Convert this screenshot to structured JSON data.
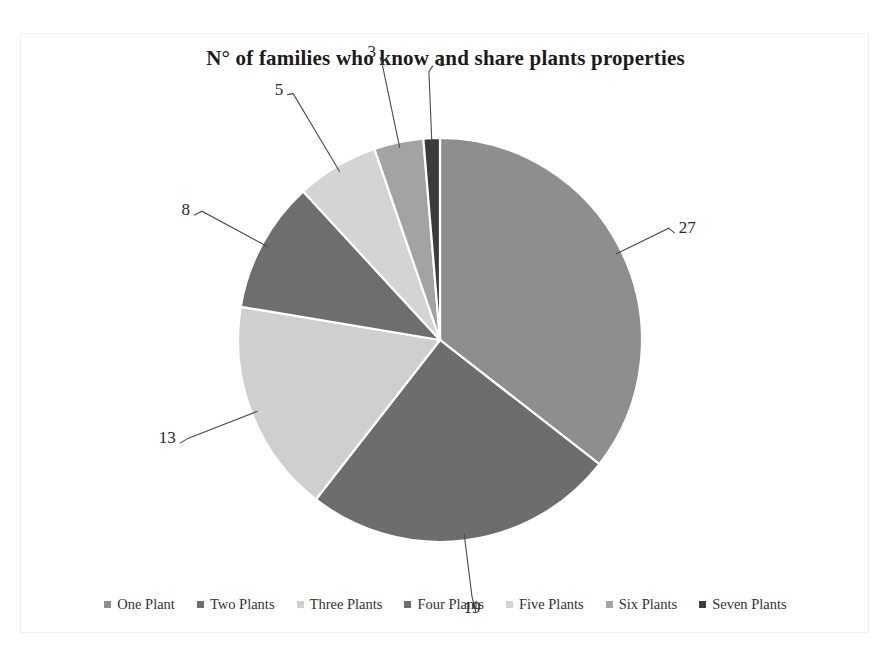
{
  "chart_data": {
    "type": "pie",
    "title": "N° of families who know and share plants properties",
    "categories": [
      "One Plant",
      "Two Plants",
      "Three Plants",
      "Four Plants",
      "Five Plants",
      "Six Plants",
      "Seven Plants"
    ],
    "values": [
      27,
      19,
      13,
      8,
      5,
      3,
      1
    ],
    "labels": [
      "27",
      "19",
      "13",
      "8",
      "5",
      "3",
      "1"
    ],
    "total": 76,
    "colors": [
      "#8e8e8e",
      "#6d6d6d",
      "#cfcfcf",
      "#6e6e6e",
      "#d4d4d4",
      "#a3a3a3",
      "#3b3b3b"
    ],
    "slice_stroke": "#ffffff",
    "legend_position": "bottom",
    "grid": false,
    "xlabel": "",
    "ylabel": "",
    "start_angle_deg": -90,
    "direction": "clockwise"
  },
  "title": {
    "text": "N° of families who know and share plants properties"
  },
  "legend": {
    "items": [
      {
        "label": "One Plant",
        "color": "#8e8e8e"
      },
      {
        "label": "Two Plants",
        "color": "#6d6d6d"
      },
      {
        "label": "Three Plants",
        "color": "#cfcfcf"
      },
      {
        "label": "Four Plants",
        "color": "#6e6e6e"
      },
      {
        "label": "Five Plants",
        "color": "#d4d4d4"
      },
      {
        "label": "Six Plants",
        "color": "#a3a3a3"
      },
      {
        "label": "Seven Plants",
        "color": "#3b3b3b"
      }
    ]
  },
  "data_labels": {
    "one": "27",
    "two": "19",
    "three": "13",
    "four": "8",
    "five": "5",
    "six": "3",
    "seven": "1"
  }
}
